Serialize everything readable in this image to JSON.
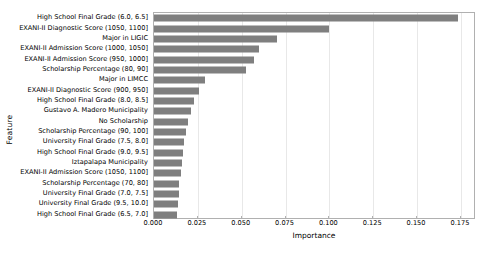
{
  "chart_data": {
    "type": "bar",
    "orientation": "horizontal",
    "title": "",
    "xlabel": "Importance",
    "ylabel": "Feature",
    "xlim": [
      0.0,
      0.1836
    ],
    "xticks": [
      0.0,
      0.025,
      0.05,
      0.075,
      0.1,
      0.125,
      0.15,
      0.175
    ],
    "xtick_labels": [
      "0.000",
      "0.025",
      "0.050",
      "0.075",
      "0.100",
      "0.125",
      "0.150",
      "0.175"
    ],
    "grid": true,
    "grid_axis": "x",
    "legend": null,
    "bar_color": "#7f7f7f",
    "categories": [
      "High School Final Grade (6.0, 6.5]",
      "EXANI-II Diagnostic Score (1050, 1100]",
      "Major in LIGIC",
      "EXANI-II Admission Score (1000, 1050]",
      "EXANI-II Admission Score (950, 1000]",
      "Scholarship Percentage (80, 90]",
      "Major in LIMCC",
      "EXANI-II Diagnostic Score (900, 950]",
      "High School Final Grade (8.0, 8.5]",
      "Gustavo A. Madero Municipality",
      "No Scholarship",
      "Scholarship Percentage (90, 100]",
      "University Final Grade (7.5, 8.0]",
      "High School Final Grade (9.0, 9.5]",
      "Iztapalapa Municipality",
      "EXANI-II Admission Score (1050, 1100]",
      "Scholarship Percentage (70, 80]",
      "University Final Grade (7.0, 7.5]",
      "University Final Grade (9.5, 10.0]",
      "High School Final Grade (6.5, 7.0]"
    ],
    "values": [
      0.1735,
      0.0997,
      0.07,
      0.06,
      0.057,
      0.0525,
      0.029,
      0.0255,
      0.023,
      0.021,
      0.0195,
      0.018,
      0.017,
      0.0165,
      0.016,
      0.0155,
      0.0145,
      0.014,
      0.0135,
      0.013
    ]
  }
}
